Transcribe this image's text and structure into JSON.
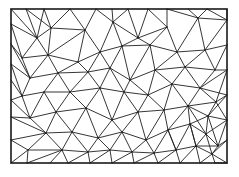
{
  "diagram": {
    "type": "triangulated-mesh",
    "colors": {
      "background": "#ffffff",
      "edge": "#1f1f1f"
    },
    "boundary": {
      "x1": 11,
      "y1": 9,
      "x2": 227,
      "y2": 163
    },
    "nodes": [
      [
        11,
        9
      ],
      [
        26,
        9
      ],
      [
        44,
        9
      ],
      [
        70,
        9
      ],
      [
        96,
        9
      ],
      [
        112,
        9
      ],
      [
        128,
        9
      ],
      [
        148,
        9
      ],
      [
        167,
        9
      ],
      [
        188,
        9
      ],
      [
        207,
        9
      ],
      [
        227,
        9
      ],
      [
        11,
        24
      ],
      [
        11,
        44
      ],
      [
        11,
        64
      ],
      [
        11,
        80
      ],
      [
        11,
        100
      ],
      [
        11,
        117
      ],
      [
        11,
        140
      ],
      [
        11,
        163
      ],
      [
        227,
        20
      ],
      [
        227,
        45
      ],
      [
        227,
        70
      ],
      [
        227,
        95
      ],
      [
        227,
        120
      ],
      [
        227,
        140
      ],
      [
        227,
        163
      ],
      [
        27,
        163
      ],
      [
        50,
        163
      ],
      [
        68,
        163
      ],
      [
        90,
        163
      ],
      [
        112,
        163
      ],
      [
        134,
        163
      ],
      [
        158,
        163
      ],
      [
        180,
        163
      ],
      [
        200,
        163
      ],
      [
        215,
        163
      ],
      [
        37,
        38
      ],
      [
        51,
        28
      ],
      [
        85,
        30
      ],
      [
        113,
        22
      ],
      [
        138,
        38
      ],
      [
        167,
        27
      ],
      [
        198,
        18
      ],
      [
        22,
        58
      ],
      [
        48,
        55
      ],
      [
        78,
        62
      ],
      [
        100,
        52
      ],
      [
        122,
        46
      ],
      [
        150,
        45
      ],
      [
        177,
        52
      ],
      [
        205,
        50
      ],
      [
        30,
        78
      ],
      [
        58,
        73
      ],
      [
        88,
        72
      ],
      [
        110,
        68
      ],
      [
        130,
        80
      ],
      [
        155,
        70
      ],
      [
        185,
        67
      ],
      [
        215,
        70
      ],
      [
        22,
        96
      ],
      [
        44,
        92
      ],
      [
        70,
        92
      ],
      [
        100,
        88
      ],
      [
        124,
        92
      ],
      [
        148,
        95
      ],
      [
        172,
        84
      ],
      [
        200,
        88
      ],
      [
        216,
        102
      ],
      [
        30,
        118
      ],
      [
        56,
        112
      ],
      [
        86,
        108
      ],
      [
        112,
        120
      ],
      [
        138,
        112
      ],
      [
        164,
        110
      ],
      [
        188,
        106
      ],
      [
        208,
        116
      ],
      [
        46,
        133
      ],
      [
        72,
        132
      ],
      [
        98,
        138
      ],
      [
        122,
        132
      ],
      [
        146,
        140
      ],
      [
        168,
        130
      ],
      [
        190,
        124
      ],
      [
        206,
        134
      ],
      [
        218,
        146
      ],
      [
        28,
        150
      ],
      [
        62,
        150
      ],
      [
        88,
        152
      ],
      [
        110,
        150
      ],
      [
        132,
        152
      ],
      [
        154,
        153
      ],
      [
        176,
        150
      ],
      [
        196,
        146
      ],
      [
        212,
        154
      ]
    ],
    "edges": [
      [
        0,
        37
      ],
      [
        1,
        37
      ],
      [
        1,
        38
      ],
      [
        2,
        38
      ],
      [
        2,
        37
      ],
      [
        3,
        38
      ],
      [
        3,
        39
      ],
      [
        4,
        39
      ],
      [
        4,
        40
      ],
      [
        5,
        40
      ],
      [
        6,
        40
      ],
      [
        6,
        41
      ],
      [
        7,
        41
      ],
      [
        7,
        42
      ],
      [
        8,
        42
      ],
      [
        8,
        43
      ],
      [
        9,
        43
      ],
      [
        10,
        43
      ],
      [
        10,
        20
      ],
      [
        11,
        20
      ],
      [
        43,
        20
      ],
      [
        43,
        51
      ],
      [
        20,
        51
      ],
      [
        21,
        51
      ],
      [
        12,
        37
      ],
      [
        12,
        44
      ],
      [
        13,
        44
      ],
      [
        37,
        44
      ],
      [
        37,
        38
      ],
      [
        38,
        45
      ],
      [
        37,
        45
      ],
      [
        44,
        45
      ],
      [
        38,
        39
      ],
      [
        39,
        45
      ],
      [
        39,
        46
      ],
      [
        39,
        47
      ],
      [
        40,
        47
      ],
      [
        40,
        48
      ],
      [
        40,
        41
      ],
      [
        41,
        48
      ],
      [
        41,
        49
      ],
      [
        41,
        42
      ],
      [
        42,
        49
      ],
      [
        42,
        50
      ],
      [
        43,
        50
      ],
      [
        50,
        51
      ],
      [
        49,
        50
      ],
      [
        13,
        52
      ],
      [
        44,
        52
      ],
      [
        45,
        52
      ],
      [
        45,
        53
      ],
      [
        46,
        53
      ],
      [
        45,
        46
      ],
      [
        46,
        47
      ],
      [
        46,
        54
      ],
      [
        47,
        54
      ],
      [
        47,
        55
      ],
      [
        48,
        55
      ],
      [
        47,
        48
      ],
      [
        48,
        49
      ],
      [
        48,
        56
      ],
      [
        55,
        56
      ],
      [
        49,
        56
      ],
      [
        49,
        57
      ],
      [
        50,
        57
      ],
      [
        50,
        58
      ],
      [
        51,
        58
      ],
      [
        51,
        59
      ],
      [
        21,
        59
      ],
      [
        58,
        59
      ],
      [
        57,
        58
      ],
      [
        56,
        57
      ],
      [
        14,
        52
      ],
      [
        14,
        60
      ],
      [
        15,
        60
      ],
      [
        52,
        60
      ],
      [
        52,
        53
      ],
      [
        53,
        61
      ],
      [
        60,
        61
      ],
      [
        53,
        62
      ],
      [
        61,
        62
      ],
      [
        53,
        54
      ],
      [
        54,
        62
      ],
      [
        54,
        63
      ],
      [
        54,
        55
      ],
      [
        55,
        63
      ],
      [
        55,
        64
      ],
      [
        56,
        64
      ],
      [
        56,
        65
      ],
      [
        57,
        65
      ],
      [
        57,
        66
      ],
      [
        58,
        66
      ],
      [
        58,
        67
      ],
      [
        59,
        67
      ],
      [
        22,
        59
      ],
      [
        22,
        67
      ],
      [
        22,
        68
      ],
      [
        67,
        68
      ],
      [
        66,
        67
      ],
      [
        65,
        66
      ],
      [
        64,
        65
      ],
      [
        63,
        64
      ],
      [
        62,
        63
      ],
      [
        16,
        60
      ],
      [
        16,
        69
      ],
      [
        60,
        69
      ],
      [
        61,
        69
      ],
      [
        61,
        70
      ],
      [
        62,
        70
      ],
      [
        62,
        71
      ],
      [
        63,
        71
      ],
      [
        63,
        72
      ],
      [
        64,
        72
      ],
      [
        64,
        73
      ],
      [
        65,
        73
      ],
      [
        65,
        74
      ],
      [
        66,
        74
      ],
      [
        66,
        75
      ],
      [
        67,
        75
      ],
      [
        68,
        75
      ],
      [
        68,
        76
      ],
      [
        23,
        68
      ],
      [
        23,
        76
      ],
      [
        24,
        76
      ],
      [
        69,
        70
      ],
      [
        70,
        71
      ],
      [
        71,
        72
      ],
      [
        72,
        73
      ],
      [
        73,
        74
      ],
      [
        74,
        75
      ],
      [
        75,
        76
      ],
      [
        17,
        69
      ],
      [
        17,
        77
      ],
      [
        69,
        77
      ],
      [
        70,
        77
      ],
      [
        70,
        78
      ],
      [
        71,
        78
      ],
      [
        71,
        79
      ],
      [
        72,
        79
      ],
      [
        72,
        80
      ],
      [
        73,
        80
      ],
      [
        73,
        81
      ],
      [
        74,
        81
      ],
      [
        74,
        82
      ],
      [
        75,
        82
      ],
      [
        75,
        83
      ],
      [
        76,
        83
      ],
      [
        76,
        84
      ],
      [
        24,
        84
      ],
      [
        24,
        85
      ],
      [
        84,
        85
      ],
      [
        83,
        84
      ],
      [
        82,
        83
      ],
      [
        81,
        82
      ],
      [
        80,
        81
      ],
      [
        79,
        80
      ],
      [
        78,
        79
      ],
      [
        77,
        78
      ],
      [
        18,
        77
      ],
      [
        18,
        86
      ],
      [
        77,
        86
      ],
      [
        77,
        87
      ],
      [
        78,
        87
      ],
      [
        78,
        88
      ],
      [
        79,
        88
      ],
      [
        79,
        89
      ],
      [
        80,
        89
      ],
      [
        80,
        90
      ],
      [
        81,
        90
      ],
      [
        81,
        91
      ],
      [
        82,
        91
      ],
      [
        82,
        92
      ],
      [
        83,
        92
      ],
      [
        83,
        93
      ],
      [
        84,
        93
      ],
      [
        84,
        94
      ],
      [
        85,
        94
      ],
      [
        25,
        85
      ],
      [
        25,
        94
      ],
      [
        26,
        94
      ],
      [
        86,
        87
      ],
      [
        87,
        88
      ],
      [
        88,
        89
      ],
      [
        89,
        90
      ],
      [
        90,
        91
      ],
      [
        91,
        92
      ],
      [
        92,
        93
      ],
      [
        93,
        94
      ],
      [
        19,
        86
      ],
      [
        27,
        86
      ],
      [
        27,
        87
      ],
      [
        28,
        87
      ],
      [
        29,
        87
      ],
      [
        29,
        88
      ],
      [
        30,
        88
      ],
      [
        30,
        89
      ],
      [
        31,
        89
      ],
      [
        31,
        90
      ],
      [
        32,
        90
      ],
      [
        32,
        91
      ],
      [
        33,
        91
      ],
      [
        33,
        92
      ],
      [
        34,
        92
      ],
      [
        34,
        93
      ],
      [
        35,
        93
      ],
      [
        35,
        94
      ],
      [
        36,
        94
      ],
      [
        26,
        36
      ],
      [
        85,
        93
      ],
      [
        83,
        93
      ],
      [
        82,
        92
      ],
      [
        75,
        84
      ],
      [
        76,
        85
      ],
      [
        68,
        24
      ],
      [
        67,
        23
      ]
    ]
  }
}
